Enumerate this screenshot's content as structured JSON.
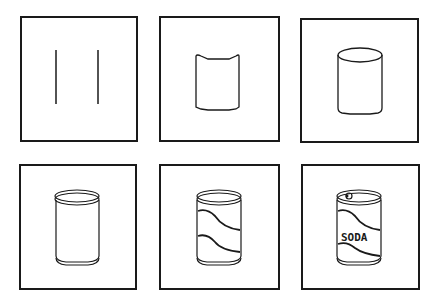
{
  "figure": {
    "type": "step-by-step drawing sequence",
    "panels": [
      {
        "step": 1,
        "description": "two vertical lines"
      },
      {
        "step": 2,
        "description": "curved top and bottom edges join the lines"
      },
      {
        "step": 3,
        "description": "elliptical top forms a cylinder"
      },
      {
        "step": 4,
        "description": "double rims added at top and bottom"
      },
      {
        "step": 5,
        "description": "two wavy label stripes added"
      },
      {
        "step": 6,
        "description": "pull-tab and label text added",
        "label_text": "SODA"
      }
    ]
  },
  "colors": {
    "stroke": "#1a1a1a",
    "background": "#ffffff"
  }
}
